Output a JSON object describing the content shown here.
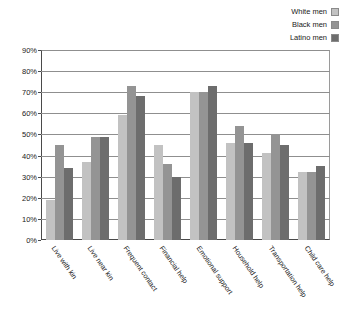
{
  "chart_data": {
    "type": "bar",
    "title": "",
    "subtitle": "",
    "xlabel": "",
    "ylabel": "",
    "ylim": [
      0,
      90
    ],
    "ytick_labels": [
      "0%",
      "10%",
      "20%",
      "30%",
      "40%",
      "50%",
      "60%",
      "70%",
      "80%",
      "90%"
    ],
    "ytick_values": [
      0,
      10,
      20,
      30,
      40,
      50,
      60,
      70,
      80,
      90
    ],
    "grid": true,
    "legend_position": "top-right",
    "categories": [
      "Live with kin",
      "Live near kin",
      "Frequent contact",
      "Financial help",
      "Emotional support",
      "Household help",
      "Transportation help",
      "Child care help"
    ],
    "series": [
      {
        "name": "White men",
        "color": "#c2c2c2",
        "values": [
          19,
          37,
          59,
          45,
          70,
          46,
          41,
          32
        ]
      },
      {
        "name": "Black men",
        "color": "#949494",
        "values": [
          45,
          49,
          73,
          36,
          70,
          54,
          50,
          32
        ]
      },
      {
        "name": "Latino men",
        "color": "#6d6d6d",
        "values": [
          34,
          49,
          68,
          30,
          73,
          46,
          45,
          35
        ]
      }
    ]
  }
}
